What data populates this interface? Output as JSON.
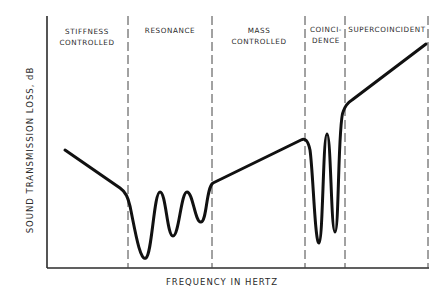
{
  "diagram": {
    "type": "sound-transmission-loss-regions",
    "y_axis_label": "SOUND TRANSMISSION LOSS, dB",
    "x_axis_label": "FREQUENCY IN HERTZ",
    "regions": [
      {
        "id": "stiffness",
        "lines": [
          "STIFFNESS",
          "CONTROLLED"
        ]
      },
      {
        "id": "resonance",
        "lines": [
          "RESONANCE"
        ]
      },
      {
        "id": "mass",
        "lines": [
          "MASS",
          "CONTROLLED"
        ]
      },
      {
        "id": "coincidence",
        "lines": [
          "COINCI-",
          "DENCE"
        ]
      },
      {
        "id": "supercoincident",
        "lines": [
          "SUPERCOINCIDENT"
        ]
      }
    ],
    "curve_description": "Transmission loss decreases in stiffness-controlled region, shows multiple resonance dips, rises linearly in mass-controlled region, dips sharply at coincidence, then rises steeply in supercoincident region",
    "colors": {
      "curve": "#111111",
      "axis": "#2b2b2b",
      "divider": "#444444",
      "text": "#2a2a2a"
    }
  }
}
